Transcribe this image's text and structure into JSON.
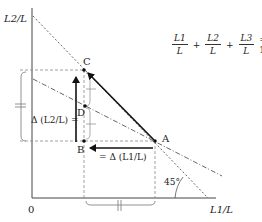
{
  "axes": {
    "y_label": "L2/L",
    "x_label": "L1/L",
    "origin_label": "0"
  },
  "equation": {
    "terms": [
      {
        "num": "L1",
        "den": "L"
      },
      {
        "num": "L2",
        "den": "L"
      },
      {
        "num": "L3",
        "den": "L"
      }
    ],
    "plus": "+",
    "equals": "= 1"
  },
  "points": {
    "A": "A",
    "B": "B",
    "C": "C",
    "D": "D"
  },
  "annotations": {
    "delta_l2": "Δ (L2/L) =",
    "delta_l1": "= Δ (L1/L)",
    "angle": "45°"
  },
  "colors": {
    "line": "#333333",
    "dashed": "#777777",
    "arrow": "#111111"
  }
}
